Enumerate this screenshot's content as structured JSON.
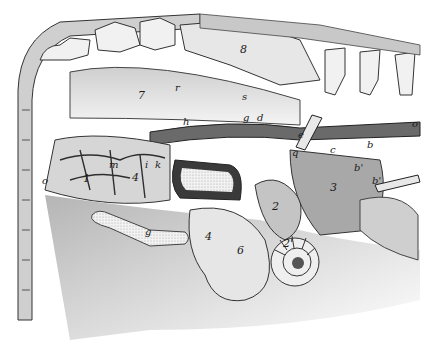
{
  "figure": {
    "labels": [
      {
        "id": "lbl-8",
        "text": "8",
        "x": 240,
        "y": 50
      },
      {
        "id": "lbl-7",
        "text": "7",
        "x": 138,
        "y": 95
      },
      {
        "id": "lbl-r",
        "text": "r",
        "x": 175,
        "y": 88
      },
      {
        "id": "lbl-s",
        "text": "s",
        "x": 242,
        "y": 97
      },
      {
        "id": "lbl-g",
        "text": "g",
        "x": 243,
        "y": 118
      },
      {
        "id": "lbl-d",
        "text": "d",
        "x": 257,
        "y": 118
      },
      {
        "id": "lbl-h",
        "text": "h",
        "x": 183,
        "y": 122
      },
      {
        "id": "lbl-o-right",
        "text": "o",
        "x": 412,
        "y": 124
      },
      {
        "id": "lbl-e",
        "text": "e",
        "x": 298,
        "y": 135
      },
      {
        "id": "lbl-c",
        "text": "c",
        "x": 330,
        "y": 150
      },
      {
        "id": "lbl-b",
        "text": "b",
        "x": 367,
        "y": 145
      },
      {
        "id": "lbl-q",
        "text": "q",
        "x": 292,
        "y": 153
      },
      {
        "id": "lbl-b2",
        "text": "b'",
        "x": 354,
        "y": 168
      },
      {
        "id": "lbl-b3",
        "text": "b'",
        "x": 372,
        "y": 181
      },
      {
        "id": "lbl-o-left",
        "text": "o",
        "x": 42,
        "y": 181
      },
      {
        "id": "lbl-m",
        "text": "m",
        "x": 109,
        "y": 165
      },
      {
        "id": "lbl-1",
        "text": "1",
        "x": 83,
        "y": 178
      },
      {
        "id": "lbl-i",
        "text": "i",
        "x": 145,
        "y": 165
      },
      {
        "id": "lbl-k",
        "text": "k",
        "x": 155,
        "y": 165
      },
      {
        "id": "lbl-4a",
        "text": "4",
        "x": 132,
        "y": 177
      },
      {
        "id": "lbl-3",
        "text": "3",
        "x": 330,
        "y": 187
      },
      {
        "id": "lbl-2",
        "text": "2",
        "x": 272,
        "y": 206
      },
      {
        "id": "lbl-g2",
        "text": "g",
        "x": 145,
        "y": 232
      },
      {
        "id": "lbl-4b",
        "text": "4",
        "x": 205,
        "y": 236
      },
      {
        "id": "lbl-6",
        "text": "6",
        "x": 237,
        "y": 250
      },
      {
        "id": "lbl-2b",
        "text": "2'",
        "x": 283,
        "y": 243
      }
    ]
  },
  "colors": {
    "background": "#ffffff",
    "tissue_light": "#d9d9d9",
    "tissue_mid": "#9a9a9a",
    "vessel": "#3a3a3a",
    "bone": "#efefef",
    "outline": "#222222"
  }
}
